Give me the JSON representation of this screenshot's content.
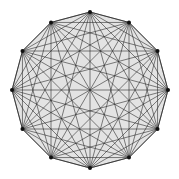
{
  "diagram": {
    "type": "complete-graph",
    "name": "K12",
    "vertex_count": 12,
    "center": [
      90,
      90
    ],
    "radius": 78,
    "start_angle_deg": -90,
    "colors": {
      "fill": "#e3e3e3",
      "edge": "#2a2a2a",
      "vertex": "#111111",
      "background": "#ffffff"
    }
  }
}
